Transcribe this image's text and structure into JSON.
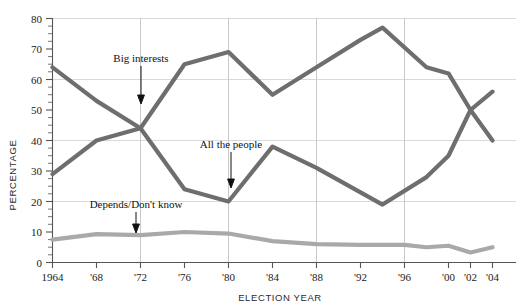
{
  "chart_data": {
    "type": "line",
    "title": "",
    "xlabel": "ELECTION YEAR",
    "ylabel": "PERCENTAGE",
    "ylim": [
      0,
      80
    ],
    "ytick_step": 10,
    "yticks": [
      "0",
      "10",
      "20",
      "30",
      "40",
      "50",
      "60",
      "70",
      "80"
    ],
    "minor_ytick_step": 2.5,
    "grid": {
      "horizontal_at": [
        20,
        40,
        60,
        80
      ],
      "vertical_at": [
        "'72",
        "'80",
        "'88",
        "'96"
      ]
    },
    "legend": {
      "position": "inline-annotations"
    },
    "x": [
      1964,
      1968,
      1972,
      1976,
      1980,
      1984,
      1988,
      1992,
      1994,
      1996,
      1998,
      2000,
      2002,
      2004
    ],
    "xtick_labels": [
      "1964",
      "'68",
      "'72",
      "'76",
      "'80",
      "'84",
      "'88",
      "'92",
      "'96",
      "'00",
      "'02",
      "'04"
    ],
    "xtick_values": [
      1964,
      1968,
      1972,
      1976,
      1980,
      1984,
      1988,
      1992,
      1996,
      2000,
      2002,
      2004
    ],
    "series": [
      {
        "name": "Big interests",
        "color": "#6e6e6e",
        "x": [
          1964,
          1968,
          1972,
          1976,
          1980,
          1984,
          1988,
          1992,
          1994,
          1998,
          2000,
          2002,
          2004
        ],
        "values": [
          29,
          40,
          44,
          65,
          69,
          55,
          64,
          73,
          77,
          64,
          62,
          50,
          40
        ]
      },
      {
        "name": "All the people",
        "color": "#6e6e6e",
        "x": [
          1964,
          1968,
          1972,
          1976,
          1980,
          1984,
          1988,
          1992,
          1994,
          1998,
          2000,
          2002,
          2004
        ],
        "values": [
          64,
          53,
          44,
          24,
          20,
          38,
          31,
          23,
          19,
          28,
          35,
          50,
          56
        ]
      },
      {
        "name": "Depends/Don't know",
        "color": "#a9a9a9",
        "x": [
          1964,
          1968,
          1972,
          1976,
          1980,
          1984,
          1988,
          1992,
          1996,
          1998,
          2000,
          2002,
          2004
        ],
        "values": [
          7.5,
          9.3,
          9,
          10,
          9.5,
          7,
          6,
          5.8,
          5.8,
          5,
          5.5,
          3.3,
          5
        ]
      }
    ],
    "annotations": [
      {
        "text": "Big interests",
        "points_to_series": "Big interests"
      },
      {
        "text": "All the people",
        "points_to_series": "All the people"
      },
      {
        "text": "Depends/Don't know",
        "points_to_series": "Depends/Don't know"
      }
    ]
  },
  "axes": {
    "y_title": "PERCENTAGE",
    "x_title": "ELECTION YEAR"
  },
  "yticks": [
    "80",
    "70",
    "60",
    "50",
    "40",
    "30",
    "20",
    "10",
    "0"
  ],
  "xticks": [
    "1964",
    "'68",
    "'72",
    "'76",
    "'80",
    "'84",
    "'88",
    "'92",
    "'96",
    "'00",
    "'02",
    "'04"
  ],
  "annotations": {
    "big_interests": "Big interests",
    "all_the_people": "All the people",
    "depends": "Depends/Don't know"
  }
}
